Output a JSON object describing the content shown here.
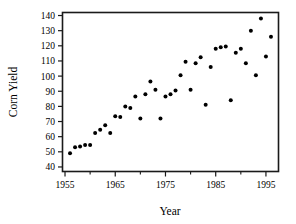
{
  "chart_data": {
    "type": "scatter",
    "title": "",
    "xlabel": "Year",
    "ylabel": "Corn Yield",
    "xlim": [
      1954.5,
      1997.5
    ],
    "ylim": [
      37,
      142
    ],
    "xticks": [
      1955,
      1965,
      1975,
      1985,
      1995
    ],
    "xtick_labels": [
      "1955",
      "1965",
      "1975",
      "1985",
      "1995"
    ],
    "xticks_minor": [
      1960,
      1970,
      1980,
      1990
    ],
    "yticks": [
      40,
      50,
      60,
      70,
      80,
      90,
      100,
      110,
      120,
      130,
      140
    ],
    "ytick_labels": [
      "40",
      "50",
      "60",
      "70",
      "80",
      "90",
      "100",
      "110",
      "120",
      "130",
      "140"
    ],
    "grid": false,
    "legend": null,
    "marker": "filled-circle",
    "marker_color": "#000000",
    "marker_size": 2.0,
    "x": [
      1956,
      1957,
      1958,
      1959,
      1960,
      1961,
      1962,
      1963,
      1964,
      1965,
      1966,
      1967,
      1968,
      1969,
      1970,
      1971,
      1972,
      1973,
      1974,
      1975,
      1976,
      1977,
      1978,
      1979,
      1980,
      1981,
      1982,
      1983,
      1984,
      1985,
      1986,
      1987,
      1988,
      1989,
      1990,
      1991,
      1992,
      1993,
      1994,
      1995,
      1996
    ],
    "y": [
      49,
      53,
      53.5,
      54.5,
      54.5,
      62.5,
      64.5,
      67.5,
      62.5,
      73.5,
      73,
      80,
      79,
      86.5,
      72,
      88,
      96.5,
      91,
      72,
      86.5,
      88,
      90.5,
      100.5,
      109.5,
      91,
      108.5,
      112.5,
      81,
      106,
      118,
      119,
      119.5,
      84,
      115.5,
      118,
      108.5,
      130,
      100.5,
      138,
      113,
      126
    ],
    "points": [
      {
        "year": 1956,
        "yield": 49
      },
      {
        "year": 1957,
        "yield": 53
      },
      {
        "year": 1958,
        "yield": 53.5
      },
      {
        "year": 1959,
        "yield": 54.5
      },
      {
        "year": 1960,
        "yield": 54.5
      },
      {
        "year": 1961,
        "yield": 62.5
      },
      {
        "year": 1962,
        "yield": 64.5
      },
      {
        "year": 1963,
        "yield": 67.5
      },
      {
        "year": 1964,
        "yield": 62.5
      },
      {
        "year": 1965,
        "yield": 73.5
      },
      {
        "year": 1966,
        "yield": 73
      },
      {
        "year": 1967,
        "yield": 80
      },
      {
        "year": 1968,
        "yield": 79
      },
      {
        "year": 1969,
        "yield": 86.5
      },
      {
        "year": 1970,
        "yield": 72
      },
      {
        "year": 1971,
        "yield": 88
      },
      {
        "year": 1972,
        "yield": 96.5
      },
      {
        "year": 1973,
        "yield": 91
      },
      {
        "year": 1974,
        "yield": 72
      },
      {
        "year": 1975,
        "yield": 86.5
      },
      {
        "year": 1976,
        "yield": 88
      },
      {
        "year": 1977,
        "yield": 90.5
      },
      {
        "year": 1978,
        "yield": 100.5
      },
      {
        "year": 1979,
        "yield": 109.5
      },
      {
        "year": 1980,
        "yield": 91
      },
      {
        "year": 1981,
        "yield": 108.5
      },
      {
        "year": 1982,
        "yield": 112.5
      },
      {
        "year": 1983,
        "yield": 81
      },
      {
        "year": 1984,
        "yield": 106
      },
      {
        "year": 1985,
        "yield": 118
      },
      {
        "year": 1986,
        "yield": 119
      },
      {
        "year": 1987,
        "yield": 119.5
      },
      {
        "year": 1988,
        "yield": 84
      },
      {
        "year": 1989,
        "yield": 115.5
      },
      {
        "year": 1990,
        "yield": 118
      },
      {
        "year": 1991,
        "yield": 108.5
      },
      {
        "year": 1992,
        "yield": 130
      },
      {
        "year": 1993,
        "yield": 100.5
      },
      {
        "year": 1994,
        "yield": 138
      },
      {
        "year": 1995,
        "yield": 113
      },
      {
        "year": 1996,
        "yield": 126
      }
    ]
  },
  "axes": {
    "frame_color": "#1a1a1a",
    "background": "#ffffff"
  }
}
